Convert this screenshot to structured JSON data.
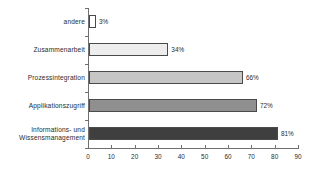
{
  "chart_data": {
    "type": "bar",
    "orientation": "horizontal",
    "title": "",
    "subtitle": "",
    "xlabel": "",
    "ylabel": "",
    "xlim": [
      0,
      90
    ],
    "xticks": [
      0,
      10,
      20,
      30,
      40,
      50,
      60,
      70,
      80,
      90
    ],
    "grid": false,
    "legend": false,
    "value_suffix": "%",
    "categories": [
      "andere",
      "Zusammenarbeit",
      "Prozessintegration",
      "Applikationszugriff",
      "Informations- und\nWissensmanagement"
    ],
    "values": [
      3,
      34,
      66,
      72,
      81
    ],
    "value_labels": [
      "3%",
      "34%",
      "66%",
      "72%",
      "81%"
    ],
    "bar_colors": [
      "#ffffff",
      "#ededed",
      "#c6c6c6",
      "#8f8f8f",
      "#3f3f3f"
    ],
    "bar_border_color": "#4a4a4a",
    "axis_color": "#6f6f6f",
    "text_color": "#2b2b2b",
    "background": "#ffffff"
  }
}
